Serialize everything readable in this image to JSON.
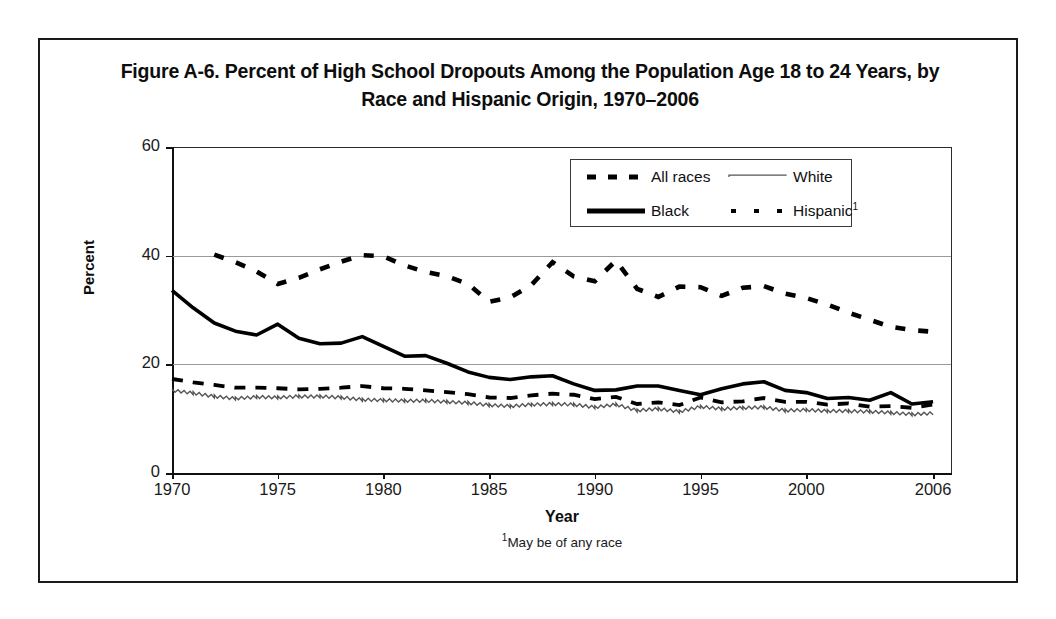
{
  "figure": {
    "title": "Figure A-6. Percent of High School Dropouts Among the Population Age 18 to 24 Years, by Race and Hispanic Origin, 1970–2006",
    "footnote": "May be of any race",
    "footnote_marker": "1"
  },
  "legend": {
    "entries": [
      {
        "label": "All races",
        "style": "thick-dashed",
        "color": "#000000"
      },
      {
        "label": "White",
        "style": "thin-wavy",
        "color": "#6a6a6a"
      },
      {
        "label": "Black",
        "style": "thick-solid",
        "color": "#000000"
      },
      {
        "label": "Hispanic",
        "sup": "1",
        "style": "dash-dot",
        "color": "#000000"
      }
    ]
  },
  "axes": {
    "y_label": "Percent",
    "x_label": "Year",
    "y_ticks": [
      "0",
      "20",
      "40",
      "60"
    ],
    "x_ticks": [
      "1970",
      "1975",
      "1980",
      "1985",
      "1990",
      "1995",
      "2000",
      "2006"
    ]
  },
  "chart_data": {
    "type": "line",
    "title": "Figure A-6. Percent of High School Dropouts Among the Population Age 18 to 24 Years, by Race and Hispanic Origin, 1970–2006",
    "xlabel": "Year",
    "ylabel": "Percent",
    "xlim": [
      1970,
      2006
    ],
    "ylim": [
      0,
      60
    ],
    "yticks": [
      0,
      20,
      40,
      60
    ],
    "xticks": [
      1970,
      1975,
      1980,
      1985,
      1990,
      1995,
      2000,
      2006
    ],
    "grid": "horizontal",
    "legend_position": "upper-center",
    "x": [
      1970,
      1971,
      1972,
      1973,
      1974,
      1975,
      1976,
      1977,
      1978,
      1979,
      1980,
      1981,
      1982,
      1983,
      1984,
      1985,
      1986,
      1987,
      1988,
      1989,
      1990,
      1991,
      1992,
      1993,
      1994,
      1995,
      1996,
      1997,
      1998,
      1999,
      2000,
      2001,
      2002,
      2003,
      2004,
      2005,
      2006
    ],
    "series": [
      {
        "name": "All races",
        "style": "thick-dashed",
        "values": [
          17.3,
          16.7,
          16.2,
          15.7,
          15.7,
          15.6,
          15.4,
          15.5,
          15.7,
          16.0,
          15.6,
          15.5,
          15.2,
          14.9,
          14.5,
          13.9,
          13.8,
          14.3,
          14.6,
          14.4,
          13.6,
          14.0,
          12.7,
          13.0,
          12.5,
          13.9,
          13.0,
          13.2,
          13.8,
          13.1,
          13.1,
          12.6,
          12.8,
          12.2,
          12.3,
          12.0,
          12.6
        ]
      },
      {
        "name": "White",
        "style": "thin-wavy",
        "values": [
          15.2,
          14.7,
          14.1,
          13.7,
          14.0,
          13.9,
          14.1,
          14.1,
          13.9,
          13.5,
          13.4,
          13.3,
          13.3,
          13.1,
          12.9,
          12.5,
          12.3,
          12.6,
          12.7,
          12.6,
          12.1,
          12.6,
          11.5,
          11.8,
          11.3,
          12.2,
          11.8,
          12.0,
          12.1,
          11.5,
          11.6,
          11.4,
          11.4,
          11.3,
          11.1,
          10.8,
          11.0
        ]
      },
      {
        "name": "Black",
        "style": "thick-solid",
        "values": [
          33.6,
          30.4,
          27.6,
          26.1,
          25.4,
          27.4,
          24.8,
          23.8,
          23.9,
          25.1,
          23.3,
          21.5,
          21.6,
          20.2,
          18.6,
          17.6,
          17.2,
          17.7,
          17.9,
          16.4,
          15.2,
          15.3,
          16.0,
          16.0,
          15.2,
          14.4,
          15.5,
          16.4,
          16.8,
          15.2,
          14.8,
          13.7,
          13.9,
          13.4,
          14.8,
          12.7,
          13.1
        ]
      },
      {
        "name": "Hispanic",
        "style": "dash-dot",
        "values": [
          null,
          null,
          40.2,
          38.8,
          37.1,
          34.8,
          35.9,
          37.5,
          38.9,
          40.1,
          39.9,
          38.2,
          37.0,
          36.2,
          34.8,
          31.5,
          32.3,
          34.6,
          38.8,
          36.2,
          35.3,
          39.1,
          33.9,
          32.4,
          34.3,
          34.2,
          32.6,
          34.1,
          34.4,
          33.0,
          32.2,
          31.0,
          29.5,
          28.2,
          26.9,
          26.3,
          26.0
        ]
      }
    ]
  }
}
